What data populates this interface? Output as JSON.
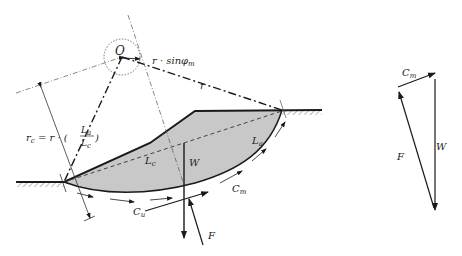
{
  "diagram": {
    "title": "",
    "type": "slope-stability-friction-circle",
    "colors": {
      "line": "#1a1a1a",
      "fill": "#c8c8c8",
      "construction": "#555555",
      "background": "#ffffff"
    },
    "labels": {
      "center": "O",
      "r_sin_phi": "r · sinφ",
      "r_sin_phi_sub": "m",
      "radius": "r",
      "rc_eq_lhs": "r",
      "rc_eq_lhs_sub": "c",
      "rc_eq_mid": " = r · (",
      "rc_frac_num": "L",
      "rc_frac_num_sub": "a",
      "rc_frac_den": "L",
      "rc_frac_den_sub": "c",
      "rc_eq_close": ")",
      "chord_length": "L",
      "chord_length_sub": "c",
      "arc_length": "L",
      "arc_length_sub": "a",
      "weight": "W",
      "cohesion_unit": "C",
      "cohesion_unit_sub": "u",
      "cohesion_mobilized": "C",
      "cohesion_mobilized_sub": "m",
      "reaction": "F"
    },
    "force_polygon": {
      "labels": {
        "cm": "C",
        "cm_sub": "m",
        "w": "W",
        "f": "F"
      }
    }
  }
}
